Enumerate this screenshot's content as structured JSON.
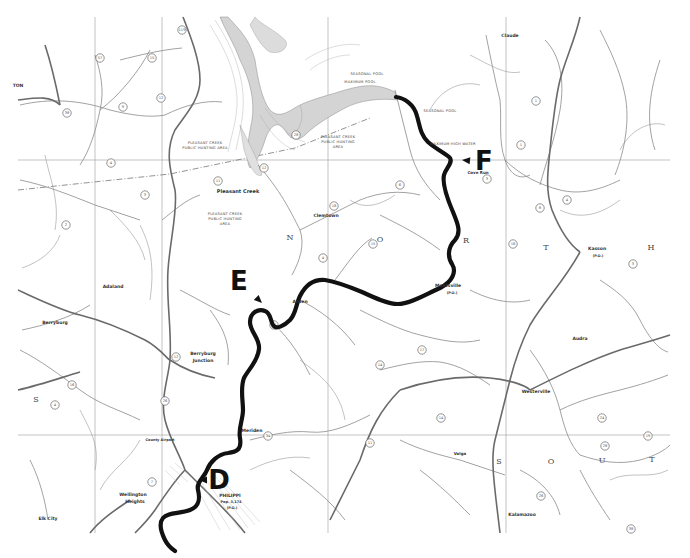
{
  "map": {
    "width": 690,
    "height": 558,
    "colors": {
      "background": "#ffffff",
      "route": "#111111",
      "roads": "#777777",
      "streams": "#999999",
      "lake": "#cfcfcf",
      "grid": "#9a9a9a"
    },
    "markers": [
      {
        "letter": "F",
        "x": 484,
        "y": 170,
        "arrow_to": [
          462,
          160
        ]
      },
      {
        "letter": "E",
        "x": 239,
        "y": 290,
        "arrow_to": [
          262,
          303
        ]
      },
      {
        "letter": "D",
        "x": 219,
        "y": 489,
        "arrow_to": [
          199,
          480
        ]
      }
    ],
    "places": [
      {
        "name": "Pleasant Creek",
        "x": 238,
        "y": 193,
        "size": 5
      },
      {
        "name": "Clemtown",
        "x": 326,
        "y": 217,
        "size": 4.5
      },
      {
        "name": "Arden",
        "x": 300,
        "y": 303,
        "size": 4.5
      },
      {
        "name": "Moatsville",
        "x": 448,
        "y": 287,
        "size": 4.5
      },
      {
        "name": "(P.O.)",
        "x": 452,
        "y": 294,
        "size": 3.5
      },
      {
        "name": "Cove Run",
        "x": 478,
        "y": 174,
        "size": 4
      },
      {
        "name": "Claude",
        "x": 510,
        "y": 37,
        "size": 4.5
      },
      {
        "name": "Kasson",
        "x": 597,
        "y": 250,
        "size": 4.5
      },
      {
        "name": "(P.O.)",
        "x": 598,
        "y": 257,
        "size": 3.5
      },
      {
        "name": "Adaland",
        "x": 113,
        "y": 288,
        "size": 4.5
      },
      {
        "name": "Berryburg",
        "x": 55,
        "y": 324,
        "size": 4.5
      },
      {
        "name": "Berryburg",
        "x": 203,
        "y": 355,
        "size": 4.5
      },
      {
        "name": "Junction",
        "x": 203,
        "y": 362,
        "size": 4.5
      },
      {
        "name": "Meriden",
        "x": 252,
        "y": 432,
        "size": 4.5
      },
      {
        "name": "Wellington",
        "x": 133,
        "y": 496,
        "size": 4.5
      },
      {
        "name": "Heights",
        "x": 135,
        "y": 503,
        "size": 4.5
      },
      {
        "name": "PHILIPPI",
        "x": 230,
        "y": 497,
        "size": 4.5
      },
      {
        "name": "Pop. 3,174",
        "x": 231,
        "y": 503,
        "size": 3.5
      },
      {
        "name": "(P.O.)",
        "x": 232,
        "y": 509,
        "size": 3.5
      },
      {
        "name": "County Airport",
        "x": 160,
        "y": 441,
        "size": 3.5
      },
      {
        "name": "Elk City",
        "x": 48,
        "y": 520,
        "size": 4.5
      },
      {
        "name": "Westerville",
        "x": 536,
        "y": 393,
        "size": 4.5
      },
      {
        "name": "Volga",
        "x": 460,
        "y": 455,
        "size": 4
      },
      {
        "name": "Kalamazoo",
        "x": 522,
        "y": 516,
        "size": 4.5
      },
      {
        "name": "Audra",
        "x": 580,
        "y": 340,
        "size": 4.5
      },
      {
        "name": "TON",
        "x": 18,
        "y": 87,
        "size": 4.5
      }
    ],
    "area_labels": [
      {
        "lines": [
          "PLEASANT CREEK",
          "PUBLIC HUNTING AREA"
        ],
        "x": 205,
        "y": 144
      },
      {
        "lines": [
          "PLEASANT CREEK",
          "PUBLIC HUNTING",
          "AREA"
        ],
        "x": 338,
        "y": 138
      },
      {
        "lines": [
          "PLEASANT CREEK",
          "PUBLIC HUNTING",
          "AREA"
        ],
        "x": 225,
        "y": 215
      },
      {
        "lines": [
          "SEASONAL POOL"
        ],
        "x": 367,
        "y": 75
      },
      {
        "lines": [
          "MAXIMUM POOL"
        ],
        "x": 360,
        "y": 83
      },
      {
        "lines": [
          "SEASONAL POOL"
        ],
        "x": 440,
        "y": 112
      },
      {
        "lines": [
          "MAXIMUM HIGH WATER"
        ],
        "x": 453,
        "y": 145
      }
    ],
    "region_letters": [
      {
        "letter": "N",
        "x": 290,
        "y": 240
      },
      {
        "letter": "O",
        "x": 380,
        "y": 242
      },
      {
        "letter": "R",
        "x": 466,
        "y": 243
      },
      {
        "letter": "T",
        "x": 546,
        "y": 250
      },
      {
        "letter": "H",
        "x": 651,
        "y": 250
      },
      {
        "letter": "S",
        "x": 36,
        "y": 402
      },
      {
        "letter": "S",
        "x": 499,
        "y": 464
      },
      {
        "letter": "O",
        "x": 551,
        "y": 464
      },
      {
        "letter": "U",
        "x": 602,
        "y": 463
      },
      {
        "letter": "T",
        "x": 652,
        "y": 462
      }
    ],
    "route_markers": [
      {
        "n": "119",
        "x": 182,
        "y": 30
      },
      {
        "n": "57",
        "x": 100,
        "y": 58
      },
      {
        "n": "38",
        "x": 67,
        "y": 113
      },
      {
        "n": "15",
        "x": 152,
        "y": 58
      },
      {
        "n": "9",
        "x": 123,
        "y": 107
      },
      {
        "n": "12",
        "x": 161,
        "y": 98
      },
      {
        "n": "4",
        "x": 111,
        "y": 163
      },
      {
        "n": "2",
        "x": 66,
        "y": 225
      },
      {
        "n": "3",
        "x": 145,
        "y": 195
      },
      {
        "n": "11",
        "x": 218,
        "y": 181
      },
      {
        "n": "12",
        "x": 264,
        "y": 168
      },
      {
        "n": "28",
        "x": 296,
        "y": 135
      },
      {
        "n": "18",
        "x": 334,
        "y": 206
      },
      {
        "n": "4",
        "x": 323,
        "y": 258
      },
      {
        "n": "15",
        "x": 373,
        "y": 244
      },
      {
        "n": "6",
        "x": 400,
        "y": 185
      },
      {
        "n": "3",
        "x": 487,
        "y": 179
      },
      {
        "n": "1",
        "x": 521,
        "y": 145
      },
      {
        "n": "1",
        "x": 536,
        "y": 101
      },
      {
        "n": "4",
        "x": 567,
        "y": 200
      },
      {
        "n": "8",
        "x": 540,
        "y": 208
      },
      {
        "n": "14",
        "x": 380,
        "y": 365
      },
      {
        "n": "14",
        "x": 274,
        "y": 325
      },
      {
        "n": "17",
        "x": 422,
        "y": 350
      },
      {
        "n": "34",
        "x": 268,
        "y": 436
      },
      {
        "n": "26",
        "x": 165,
        "y": 401
      },
      {
        "n": "12",
        "x": 176,
        "y": 357
      },
      {
        "n": "4",
        "x": 55,
        "y": 405
      },
      {
        "n": "16",
        "x": 72,
        "y": 385
      },
      {
        "n": "7",
        "x": 152,
        "y": 482
      },
      {
        "n": "28",
        "x": 605,
        "y": 446
      },
      {
        "n": "19",
        "x": 648,
        "y": 436
      },
      {
        "n": "24",
        "x": 602,
        "y": 418
      },
      {
        "n": "11",
        "x": 370,
        "y": 443
      },
      {
        "n": "14",
        "x": 441,
        "y": 418
      },
      {
        "n": "26",
        "x": 541,
        "y": 496
      },
      {
        "n": "38",
        "x": 631,
        "y": 529
      },
      {
        "n": "3",
        "x": 633,
        "y": 264
      },
      {
        "n": "16",
        "x": 513,
        "y": 244
      }
    ],
    "route_path": "M 396 97 C 404 98 414 104 417 116 C 420 126 420 134 428 142 C 437 150 447 154 450 158 C 453 163 446 168 444 175 C 442 184 447 198 453 212 C 457 222 462 232 455 240 C 447 248 448 258 452 264 C 457 272 452 282 440 288 C 426 294 410 304 398 304 C 388 304 375 298 362 292 C 350 287 338 282 325 280 C 313 279 305 286 300 296 C 296 304 296 314 290 320 C 284 326 276 330 273 325 C 270 320 271 313 265 311 C 258 308 250 313 250 322 C 250 332 260 338 259 349 C 258 361 248 370 244 378 C 240 388 243 400 243 410 C 243 420 238 428 240 438 C 242 450 236 452 228 453 C 218 454 210 462 207 470 C 204 478 196 482 198 490 C 200 498 200 506 190 510 C 180 514 168 512 163 518 C 158 524 162 534 165 540 C 168 546 172 549 175 551"
  }
}
